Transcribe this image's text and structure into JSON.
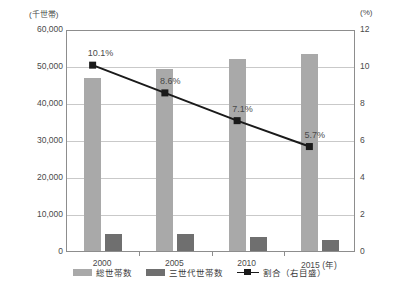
{
  "chart_data": {
    "type": "bar",
    "title": "",
    "xlabel": "(年)",
    "categories": [
      "2000",
      "2005",
      "2010",
      "2015"
    ],
    "left_axis": {
      "unit_label": "(千世帯)",
      "ticks": [
        "60,000",
        "50,000",
        "40,000",
        "30,000",
        "20,000",
        "10,000",
        "0"
      ],
      "tick_values": [
        60000,
        50000,
        40000,
        30000,
        20000,
        10000,
        0
      ],
      "ylim": [
        0,
        60000
      ],
      "ylabel": "千世帯"
    },
    "right_axis": {
      "unit_label": "(%)",
      "ticks": [
        "12",
        "10",
        "8",
        "6",
        "4",
        "2",
        "0"
      ],
      "tick_values": [
        12,
        10,
        8,
        6,
        4,
        2,
        0
      ],
      "ylim": [
        0,
        12
      ],
      "ylabel": "%"
    },
    "grid": true,
    "legend_position": "bottom",
    "series": [
      {
        "name": "総世帯数",
        "type": "bar",
        "axis": "left",
        "color": "#a9a9a9",
        "values": [
          46782,
          49063,
          51842,
          53332
        ]
      },
      {
        "name": "三世代世帯数",
        "type": "bar",
        "axis": "left",
        "color": "#6f6f6f",
        "values": [
          4716,
          4575,
          3658,
          2947
        ]
      },
      {
        "name": "割合（右目盛）",
        "type": "line",
        "axis": "right",
        "color": "#1a1a1a",
        "values": [
          10.1,
          8.6,
          7.1,
          5.7
        ],
        "data_labels": [
          "10.1%",
          "8.6%",
          "7.1%",
          "5.7%"
        ]
      }
    ]
  },
  "legend": {
    "items": [
      {
        "label": "総世帯数",
        "marker": "square-swatch-light-grey"
      },
      {
        "label": "三世代世帯数",
        "marker": "square-swatch-dark-grey"
      },
      {
        "label": "割合（右目盛）",
        "marker": "line-with-square-marker"
      }
    ]
  },
  "colors": {
    "bar_total": "#a9a9a9",
    "bar_three_gen": "#6f6f6f",
    "line": "#1a1a1a",
    "grid": "#c9c9c9",
    "axis": "#8d8d8d",
    "text": "#3a3a3a",
    "background": "#ffffff"
  }
}
